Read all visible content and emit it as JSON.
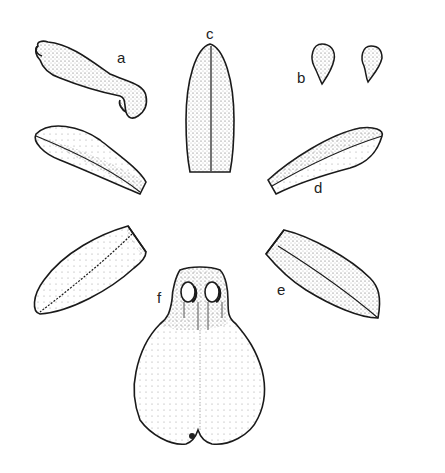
{
  "figure": {
    "background": "#ffffff",
    "ink_color": "#1a1a1a",
    "labels": [
      {
        "id": "a",
        "text": "a",
        "x": 117,
        "y": 50
      },
      {
        "id": "b",
        "text": "b",
        "x": 297,
        "y": 70
      },
      {
        "id": "c",
        "text": "c",
        "x": 206,
        "y": 28
      },
      {
        "id": "d",
        "text": "d",
        "x": 314,
        "y": 182
      },
      {
        "id": "e",
        "text": "e",
        "x": 277,
        "y": 284
      },
      {
        "id": "f",
        "text": "f",
        "x": 157,
        "y": 290
      }
    ],
    "parts": [
      {
        "id": "a",
        "name": "column"
      },
      {
        "id": "b",
        "name": "pollinia"
      },
      {
        "id": "c",
        "name": "dorsal sepal"
      },
      {
        "id": "d",
        "name": "petals"
      },
      {
        "id": "e",
        "name": "lateral sepals"
      },
      {
        "id": "f",
        "name": "lip"
      }
    ]
  }
}
